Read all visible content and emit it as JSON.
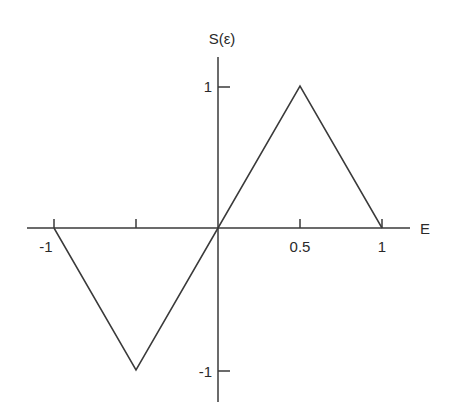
{
  "chart_data": {
    "type": "line",
    "title": "",
    "xlabel": "E",
    "ylabel": "S(ε)",
    "xlim": [
      -1.2,
      1.15
    ],
    "ylim": [
      -1.1,
      1.1
    ],
    "grid": false,
    "legend": null,
    "x_ticks": [
      -1,
      -0.5,
      0.5,
      1
    ],
    "x_tick_labels": [
      "-1",
      "",
      "0.5",
      "1"
    ],
    "y_ticks": [
      1,
      -1
    ],
    "y_tick_labels": [
      "1",
      "-1"
    ],
    "series": [
      {
        "name": "S(ε)",
        "x": [
          -1,
          -0.5,
          0,
          0.5,
          1
        ],
        "y": [
          0,
          -1,
          0,
          1,
          0
        ]
      }
    ]
  },
  "colors": {
    "line": "#3a3a3a",
    "axis": "#3a3a3a",
    "text": "#2a2a2a",
    "background": "#ffffff"
  }
}
